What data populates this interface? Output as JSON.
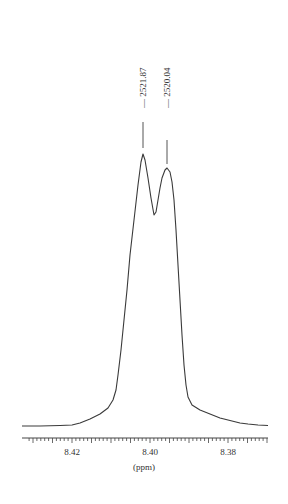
{
  "chart_data": {
    "type": "line",
    "title": "",
    "xlabel": "(ppm)",
    "ylabel": "",
    "x_reversed": true,
    "xlim": [
      8.431,
      8.389
    ],
    "x_ticks": [
      8.42,
      8.4,
      8.38
    ],
    "x_tick_labels": [
      "8.42",
      "8.40",
      "8.38"
    ],
    "minor_tick_step": 0.001,
    "grid": false,
    "legend": null,
    "peaks": [
      {
        "label": "2521.87",
        "ppm": 8.4018,
        "relative_intensity": 1.0
      },
      {
        "label": "2520.04",
        "ppm": 8.3956,
        "relative_intensity": 0.95
      }
    ],
    "series": [
      {
        "name": "spectrum",
        "x": [
          8.431,
          8.426,
          8.422,
          8.418,
          8.414,
          8.411,
          8.409,
          8.4075,
          8.4065,
          8.4055,
          8.4045,
          8.4035,
          8.4025,
          8.4018,
          8.4008,
          8.3998,
          8.3988,
          8.3978,
          8.3968,
          8.3956,
          8.3946,
          8.3936,
          8.3926,
          8.3916,
          8.3906,
          8.3896,
          8.3886,
          8.388,
          8.386,
          8.382,
          8.378,
          8.374,
          8.37,
          8.366,
          8.362,
          8.389
        ],
        "y": [
          0.0,
          0.0,
          0.01,
          0.02,
          0.05,
          0.09,
          0.13,
          0.18,
          0.26,
          0.38,
          0.55,
          0.75,
          0.93,
          1.0,
          0.88,
          0.75,
          0.83,
          0.92,
          0.95,
          0.95,
          0.88,
          0.72,
          0.52,
          0.35,
          0.22,
          0.14,
          0.1,
          0.09,
          0.07,
          0.05,
          0.03,
          0.02,
          0.01,
          0.0,
          0.0,
          0.0
        ]
      }
    ]
  },
  "labels": {
    "xlabel": "(ppm)",
    "tick_8_42": "8.42",
    "tick_8_40": "8.40",
    "tick_8_38": "8.38",
    "peak1": "2521.87",
    "peak2": "2520.04"
  },
  "colors": {
    "line": "#3a3a3a",
    "axis": "#444444",
    "background": "#ffffff"
  }
}
